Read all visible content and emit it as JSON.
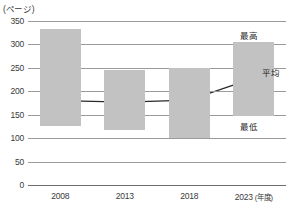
{
  "chart_data": {
    "type": "bar",
    "title": "",
    "subtitle": "",
    "xlabel": "年度",
    "ylabel": "ページ",
    "unit_label": "(ページ)",
    "categories": [
      "2008",
      "2013",
      "2018",
      "2023"
    ],
    "x_axis_suffix": "(年度)",
    "ylim": [
      0,
      350
    ],
    "ytick_values": [
      0,
      50,
      100,
      150,
      200,
      250,
      300,
      350
    ],
    "ytick_labels": [
      "0",
      "50",
      "100",
      "150",
      "200",
      "250",
      "300",
      "350"
    ],
    "grid": true,
    "legend_position": "inline-annotations",
    "series": [
      {
        "name": "最高",
        "role": "range-top",
        "values": [
          332,
          245,
          250,
          305
        ]
      },
      {
        "name": "最低",
        "role": "range-bottom",
        "values": [
          125,
          117,
          100,
          148
        ]
      },
      {
        "name": "平均",
        "role": "line",
        "values": [
          180,
          177,
          181,
          228
        ]
      }
    ],
    "annotations": [
      {
        "text": "最高",
        "series": "最高"
      },
      {
        "text": "平均",
        "series": "平均"
      },
      {
        "text": "最低",
        "series": "最低"
      }
    ],
    "colors": {
      "bar": "#c2c2c2",
      "line": "#2a2a2a",
      "marker": "#1a1a1a",
      "grid": "#9a9a9a",
      "axis": "#6d6d6d",
      "text": "#3a3a3a"
    }
  },
  "annotation_labels": {
    "max": "最高",
    "avg": "平均",
    "min": "最低"
  }
}
